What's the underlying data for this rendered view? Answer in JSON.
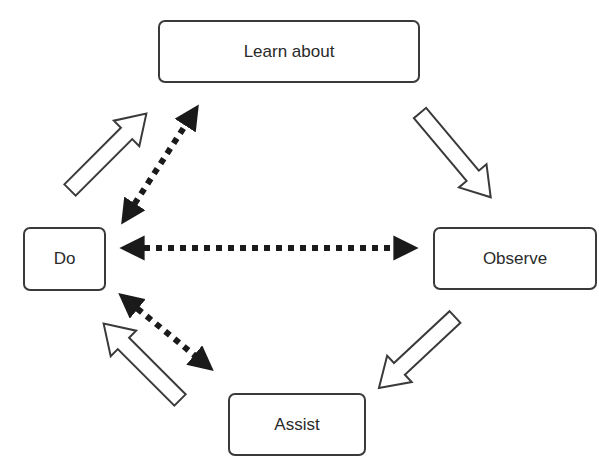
{
  "diagram": {
    "type": "cycle",
    "nodes": [
      {
        "id": "learn",
        "label": "Learn about",
        "x": 158,
        "y": 20,
        "w": 262,
        "h": 63
      },
      {
        "id": "observe",
        "label": "Observe",
        "x": 433,
        "y": 227,
        "w": 164,
        "h": 63
      },
      {
        "id": "assist",
        "label": "Assist",
        "x": 228,
        "y": 393,
        "w": 138,
        "h": 63
      },
      {
        "id": "do",
        "label": "Do",
        "x": 23,
        "y": 227,
        "w": 83,
        "h": 64
      }
    ],
    "cycle_arrows": [
      {
        "from": "learn",
        "to": "observe",
        "style": "hollow"
      },
      {
        "from": "observe",
        "to": "assist",
        "style": "hollow"
      },
      {
        "from": "assist",
        "to": "do",
        "style": "hollow"
      },
      {
        "from": "do",
        "to": "learn",
        "style": "hollow"
      }
    ],
    "bidirectional_arrows": [
      {
        "between": [
          "do",
          "learn"
        ],
        "style": "dotted"
      },
      {
        "between": [
          "do",
          "observe"
        ],
        "style": "dotted"
      },
      {
        "between": [
          "do",
          "assist"
        ],
        "style": "dotted"
      }
    ],
    "colors": {
      "stroke": "#3a3a3a",
      "fill": "#ffffff",
      "dotted": "#1a1a1a",
      "text": "#2a2a2a"
    }
  }
}
